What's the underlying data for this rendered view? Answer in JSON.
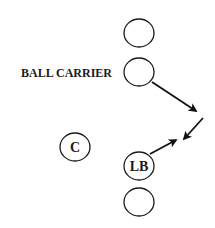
{
  "diagram": {
    "type": "football-play",
    "colors": {
      "stroke": "#1a1a1a",
      "background": "#ffffff"
    },
    "labels": {
      "ball_carrier": "BALL CARRIER",
      "center": "C",
      "linebacker": "LB"
    },
    "players": [
      {
        "id": "top-player",
        "label": "",
        "cx": 139,
        "cy": 33
      },
      {
        "id": "ball-carrier",
        "label": "",
        "cx": 139,
        "cy": 72
      },
      {
        "id": "center",
        "label": "C",
        "cx": 75,
        "cy": 147
      },
      {
        "id": "linebacker",
        "label": "LB",
        "cx": 139,
        "cy": 166
      },
      {
        "id": "bottom-player",
        "label": "",
        "cx": 139,
        "cy": 202
      }
    ],
    "arrows": [
      {
        "id": "ball-carrier-path",
        "from": [
          152,
          82
        ],
        "to": [
          196,
          111
        ]
      },
      {
        "id": "converge-arrow",
        "from": [
          203,
          118
        ],
        "to": [
          184,
          139
        ]
      },
      {
        "id": "linebacker-path",
        "from": [
          150,
          154
        ],
        "to": [
          176,
          140
        ]
      }
    ]
  }
}
